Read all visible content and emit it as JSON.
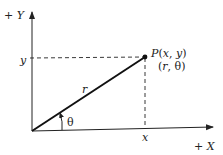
{
  "diagram": {
    "type": "polar-cartesian-coordinates",
    "axes": {
      "y_label": "+Y",
      "x_label": "+X"
    },
    "point": {
      "label_cartesian": "P(x, y)",
      "label_polar": "(r, θ)"
    },
    "tick_labels": {
      "x": "x",
      "y": "y"
    },
    "radius_label": "r",
    "angle_label": "θ",
    "colors": {
      "stroke": "#222222",
      "background": "#ffffff"
    }
  }
}
